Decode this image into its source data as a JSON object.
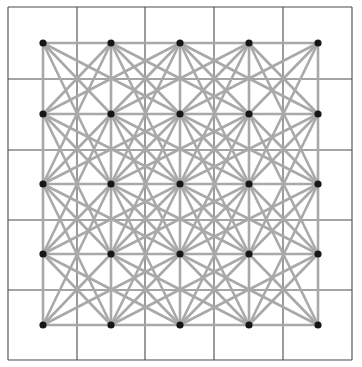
{
  "diagram": {
    "type": "grid-graph",
    "canvas": {
      "width": 362,
      "height": 367
    },
    "grid": {
      "x_lines": [
        8,
        77,
        145,
        214,
        283,
        352
      ],
      "y_lines": [
        7,
        79,
        150,
        220,
        290,
        360
      ],
      "color": "#4a4a4a"
    },
    "nodes": {
      "columns": 5,
      "rows": 5,
      "x": [
        43,
        111,
        180,
        249,
        318
      ],
      "y": [
        43,
        114,
        184,
        254,
        325
      ],
      "radius": 3.6,
      "color": "#161616"
    },
    "edges": {
      "rule": "connect each node to orthogonal neighbors, diagonal neighbors, and knight-move (2,1)/(1,2) nodes",
      "offsets": [
        [
          1,
          0
        ],
        [
          0,
          1
        ],
        [
          1,
          1
        ],
        [
          -1,
          1
        ],
        [
          2,
          1
        ],
        [
          1,
          2
        ],
        [
          -2,
          1
        ],
        [
          -1,
          2
        ]
      ],
      "color": "#a9a9a9"
    }
  }
}
